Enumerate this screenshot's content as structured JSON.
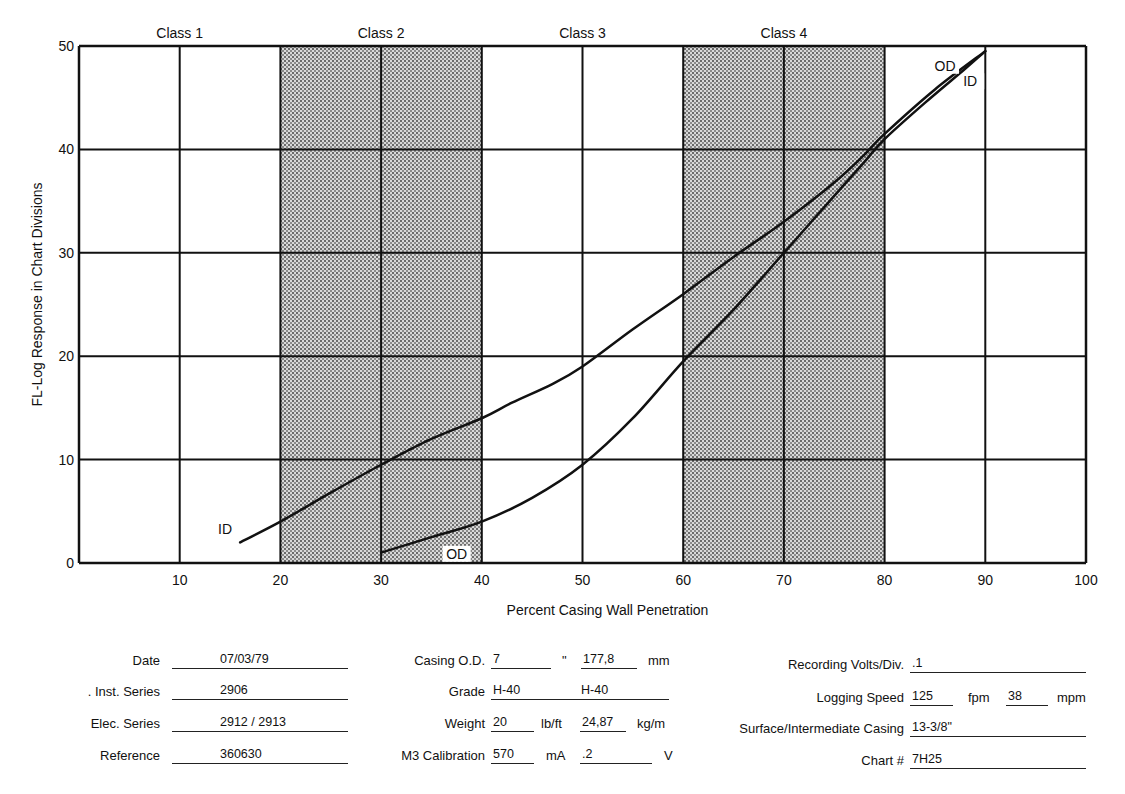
{
  "chart_data": {
    "type": "line",
    "title": "",
    "xlabel": "Percent Casing Wall Penetration",
    "ylabel": "FL-Log Response in Chart Divisions",
    "xlim": [
      0,
      100
    ],
    "ylim": [
      0,
      50
    ],
    "x_ticks": [
      10,
      20,
      30,
      40,
      50,
      60,
      70,
      80,
      90,
      100
    ],
    "y_ticks": [
      0,
      10,
      20,
      30,
      40,
      50
    ],
    "grid": true,
    "class_bands": [
      {
        "label": "Class 1",
        "x_from": 0,
        "x_to": 20,
        "shaded": false
      },
      {
        "label": "Class 2",
        "x_from": 20,
        "x_to": 40,
        "shaded": true
      },
      {
        "label": "Class 3",
        "x_from": 40,
        "x_to": 60,
        "shaded": false
      },
      {
        "label": "Class 4",
        "x_from": 60,
        "x_to": 80,
        "shaded": true
      }
    ],
    "series": [
      {
        "name": "ID",
        "x": [
          16,
          20,
          25,
          30,
          35,
          40,
          43,
          47,
          50,
          55,
          60,
          65,
          70,
          75,
          78,
          80,
          85,
          90
        ],
        "y": [
          2,
          4,
          6.8,
          9.5,
          12,
          14,
          15.5,
          17.3,
          19,
          22.6,
          26,
          29.6,
          33,
          36.8,
          39.5,
          41.5,
          45.8,
          49.5
        ],
        "label_positions": [
          {
            "x": 14.5,
            "y": 3
          },
          {
            "x": 88.5,
            "y": 46.3
          }
        ]
      },
      {
        "name": "OD",
        "x": [
          30,
          35,
          40,
          45,
          50,
          55,
          60,
          65,
          70,
          75,
          78,
          80,
          84,
          88,
          90
        ],
        "y": [
          1,
          2.5,
          4,
          6.3,
          9.5,
          14,
          19.5,
          24.5,
          30,
          35.5,
          38.8,
          41,
          44.5,
          47.8,
          49.5
        ],
        "label_positions": [
          {
            "x": 37.5,
            "y": 0.6
          },
          {
            "x": 86,
            "y": 47.8
          }
        ]
      }
    ]
  },
  "form": {
    "col1": [
      {
        "label": "Date",
        "value": "07/03/79"
      },
      {
        "label": ". Inst. Series",
        "value": "2906"
      },
      {
        "label": "Elec. Series",
        "value": "2912 / 2913"
      },
      {
        "label": "Reference",
        "value": "360630"
      }
    ],
    "col2": {
      "casing_od": {
        "label": "Casing O.D.",
        "value_in": "7",
        "unit_in": "\"",
        "value_mm": "177,8",
        "unit_mm": "mm"
      },
      "grade": {
        "label": "Grade",
        "value1": "H-40",
        "value2": "H-40"
      },
      "weight": {
        "label": "Weight",
        "value_lb": "20",
        "unit_lb": "lb/ft",
        "value_kg": "24,87",
        "unit_kg": "kg/m"
      },
      "m3_calibration": {
        "label": "M3 Calibration",
        "value_ma": "570",
        "unit_ma": "mA",
        "value_v": ".2",
        "unit_v": "V"
      }
    },
    "col3": {
      "recording_volts": {
        "label": "Recording Volts/Div.",
        "value": ".1"
      },
      "logging_speed": {
        "label": "Logging Speed",
        "value_fpm": "125",
        "unit_fpm": "fpm",
        "value_mpm": "38",
        "unit_mpm": "mpm"
      },
      "surface_casing": {
        "label": "Surface/Intermediate Casing",
        "value": "13-3/8\""
      },
      "chart_number": {
        "label": "Chart #",
        "value": "7H25"
      }
    }
  }
}
